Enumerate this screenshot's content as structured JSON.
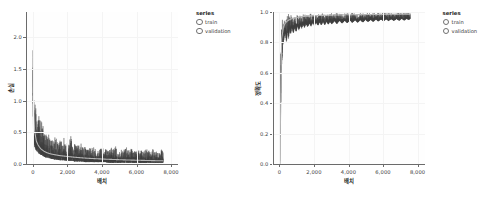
{
  "legend": {
    "title": "series",
    "items": [
      {
        "label": "train",
        "marker": "circle-outline-icon",
        "color": "#3d3d3d"
      },
      {
        "label": "validation",
        "marker": "circle-outline-icon",
        "color": "#b9b9b9"
      }
    ]
  },
  "colors": {
    "train": "#3d3d3d",
    "validation": "#b5b5b5",
    "axis": "#6b6b6b",
    "grid": "#f4f4f4",
    "text": "#3a3a3a",
    "title": "#1d1d1d",
    "plot_background": "#fefefe",
    "page_background": "#ffffff"
  },
  "chart_data": [
    {
      "type": "line",
      "title": "",
      "xlabel": "배치",
      "ylabel": "손실",
      "xlim": [
        -400,
        8400
      ],
      "ylim": [
        0.0,
        2.4
      ],
      "xticks": [
        0,
        2000,
        4000,
        6000,
        8000
      ],
      "xtick_labels": [
        "0",
        "2,000",
        "4,000",
        "6,000",
        "8,000"
      ],
      "yticks": [
        0.0,
        0.5,
        1.0,
        1.5,
        2.0
      ],
      "ytick_labels": [
        "0.0",
        "0.5",
        "1.0",
        "1.5",
        "2.0"
      ],
      "grid": true,
      "legend_position": "right",
      "series": [
        {
          "name": "train",
          "color": "#3d3d3d",
          "description": "noisy per-batch training loss, starts ~2.3, decays rapidly then oscillates",
          "x": [
            0,
            40,
            80,
            120,
            160,
            200,
            260,
            320,
            380,
            440,
            500,
            560,
            620,
            700,
            780,
            860,
            940,
            1020,
            1100,
            1180,
            1260,
            1340,
            1420,
            1500,
            1600,
            1700,
            1800,
            1900,
            2000,
            2100,
            2200,
            2300,
            2400,
            2500,
            2600,
            2700,
            2800,
            2900,
            3000,
            3150,
            3300,
            3450,
            3600,
            3750,
            3900,
            4050,
            4200,
            4350,
            4500,
            4650,
            4800,
            4950,
            5100,
            5250,
            5400,
            5550,
            5700,
            5850,
            6000,
            6150,
            6300,
            6450,
            6600,
            6750,
            6900,
            7050,
            7200,
            7350,
            7450,
            7550
          ],
          "upper": [
            2.3,
            1.2,
            0.9,
            0.86,
            0.84,
            0.8,
            0.76,
            0.72,
            0.68,
            0.64,
            0.6,
            0.56,
            0.52,
            0.5,
            0.47,
            0.45,
            0.42,
            0.4,
            0.38,
            0.37,
            0.36,
            0.45,
            0.33,
            0.32,
            0.42,
            0.3,
            0.38,
            0.29,
            0.31,
            0.28,
            0.46,
            0.27,
            0.32,
            0.26,
            0.3,
            0.25,
            0.29,
            0.25,
            0.28,
            0.24,
            0.27,
            0.23,
            0.26,
            0.23,
            0.25,
            0.22,
            0.26,
            0.22,
            0.24,
            0.21,
            0.25,
            0.21,
            0.23,
            0.2,
            0.24,
            0.2,
            0.22,
            0.2,
            0.23,
            0.19,
            0.22,
            0.19,
            0.21,
            0.19,
            0.22,
            0.18,
            0.21,
            0.18,
            0.26,
            0.17
          ],
          "lower": [
            0.95,
            0.45,
            0.3,
            0.26,
            0.23,
            0.21,
            0.19,
            0.17,
            0.16,
            0.15,
            0.14,
            0.13,
            0.12,
            0.11,
            0.1,
            0.1,
            0.09,
            0.09,
            0.08,
            0.08,
            0.07,
            0.07,
            0.07,
            0.06,
            0.06,
            0.06,
            0.06,
            0.05,
            0.05,
            0.05,
            0.05,
            0.05,
            0.04,
            0.04,
            0.04,
            0.04,
            0.04,
            0.04,
            0.03,
            0.03,
            0.03,
            0.03,
            0.03,
            0.03,
            0.03,
            0.03,
            0.03,
            0.02,
            0.02,
            0.02,
            0.02,
            0.02,
            0.02,
            0.02,
            0.02,
            0.02,
            0.02,
            0.02,
            0.02,
            0.02,
            0.02,
            0.02,
            0.02,
            0.02,
            0.02,
            0.02,
            0.02,
            0.02,
            0.02,
            0.02
          ]
        },
        {
          "name": "validation",
          "color": "#b5b5b5",
          "description": "smooth validation loss, decays from ~1.1 to ~0.05",
          "x": [
            0,
            100,
            200,
            300,
            400,
            500,
            650,
            800,
            950,
            1100,
            1300,
            1500,
            1700,
            1900,
            2100,
            2300,
            2500,
            2800,
            3100,
            3400,
            3700,
            4000,
            4300,
            4600,
            4900,
            5200,
            5500,
            5800,
            6100,
            6400,
            6700,
            7000,
            7300,
            7550
          ],
          "y": [
            1.08,
            0.52,
            0.36,
            0.3,
            0.26,
            0.23,
            0.2,
            0.18,
            0.165,
            0.155,
            0.145,
            0.135,
            0.128,
            0.122,
            0.116,
            0.11,
            0.105,
            0.098,
            0.092,
            0.087,
            0.083,
            0.079,
            0.075,
            0.072,
            0.069,
            0.066,
            0.063,
            0.061,
            0.059,
            0.057,
            0.055,
            0.053,
            0.051,
            0.05
          ]
        }
      ]
    },
    {
      "type": "line",
      "title": "",
      "xlabel": "배치",
      "ylabel": "정확도",
      "xlim": [
        -400,
        8400
      ],
      "ylim": [
        0.0,
        1.0
      ],
      "xticks": [
        0,
        2000,
        4000,
        6000,
        8000
      ],
      "xtick_labels": [
        "0",
        "2,000",
        "4,000",
        "6,000",
        "8,000"
      ],
      "yticks": [
        0.0,
        0.2,
        0.4,
        0.6,
        0.8,
        1.0
      ],
      "ytick_labels": [
        "0.0",
        "0.2",
        "0.4",
        "0.6",
        "0.8",
        "1.0"
      ],
      "grid": true,
      "legend_position": "right",
      "series": [
        {
          "name": "train",
          "color": "#3d3d3d",
          "description": "noisy per-batch training accuracy, rises from ~0.0 to ~0.99 with downward spikes",
          "x": [
            0,
            40,
            80,
            120,
            160,
            200,
            260,
            320,
            380,
            440,
            500,
            560,
            620,
            700,
            780,
            860,
            940,
            1020,
            1100,
            1180,
            1260,
            1340,
            1420,
            1500,
            1600,
            1700,
            1800,
            1900,
            2000,
            2100,
            2200,
            2300,
            2400,
            2500,
            2600,
            2700,
            2800,
            2900,
            3000,
            3150,
            3300,
            3450,
            3600,
            3750,
            3900,
            4050,
            4200,
            4350,
            4500,
            4650,
            4800,
            4950,
            5100,
            5250,
            5400,
            5550,
            5700,
            5850,
            6000,
            6150,
            6300,
            6450,
            6600,
            6750,
            6900,
            7050,
            7200,
            7350,
            7450,
            7550
          ],
          "upper": [
            0.1,
            0.78,
            0.9,
            0.93,
            0.94,
            0.95,
            0.955,
            0.96,
            0.962,
            0.965,
            0.967,
            0.968,
            0.97,
            0.971,
            0.972,
            0.973,
            0.974,
            0.975,
            0.975,
            0.976,
            0.977,
            0.977,
            0.978,
            0.978,
            0.979,
            0.979,
            0.98,
            0.98,
            0.981,
            0.981,
            0.982,
            0.982,
            0.982,
            0.983,
            0.983,
            0.983,
            0.984,
            0.984,
            0.984,
            0.985,
            0.985,
            0.985,
            0.986,
            0.986,
            0.986,
            0.987,
            0.987,
            0.987,
            0.987,
            0.988,
            0.988,
            0.988,
            0.988,
            0.989,
            0.989,
            0.989,
            0.989,
            0.99,
            0.99,
            0.99,
            0.99,
            0.99,
            0.991,
            0.991,
            0.991,
            0.991,
            0.991,
            0.992,
            0.992,
            0.992
          ],
          "lower": [
            0.0,
            0.33,
            0.6,
            0.7,
            0.78,
            0.8,
            0.84,
            0.86,
            0.8,
            0.88,
            0.82,
            0.89,
            0.855,
            0.9,
            0.86,
            0.905,
            0.87,
            0.91,
            0.88,
            0.915,
            0.89,
            0.92,
            0.895,
            0.925,
            0.9,
            0.928,
            0.905,
            0.93,
            0.908,
            0.932,
            0.91,
            0.934,
            0.912,
            0.936,
            0.915,
            0.938,
            0.918,
            0.94,
            0.92,
            0.941,
            0.922,
            0.943,
            0.925,
            0.944,
            0.927,
            0.946,
            0.929,
            0.947,
            0.93,
            0.948,
            0.932,
            0.949,
            0.934,
            0.95,
            0.936,
            0.951,
            0.938,
            0.952,
            0.94,
            0.953,
            0.941,
            0.954,
            0.942,
            0.955,
            0.943,
            0.956,
            0.944,
            0.957,
            0.945,
            0.958
          ]
        },
        {
          "name": "validation",
          "color": "#b5b5b5",
          "description": "smooth validation accuracy, rises from ~0.0 to ~0.985",
          "x": [
            0,
            100,
            200,
            300,
            400,
            500,
            650,
            800,
            950,
            1100,
            1300,
            1500,
            1700,
            1900,
            2100,
            2300,
            2500,
            2800,
            3100,
            3400,
            3700,
            4000,
            4300,
            4600,
            4900,
            5200,
            5500,
            5800,
            6100,
            6400,
            6700,
            7000,
            7300,
            7550
          ],
          "y": [
            0.02,
            0.82,
            0.9,
            0.925,
            0.938,
            0.946,
            0.954,
            0.96,
            0.964,
            0.967,
            0.97,
            0.972,
            0.974,
            0.975,
            0.976,
            0.977,
            0.978,
            0.979,
            0.98,
            0.981,
            0.981,
            0.982,
            0.982,
            0.983,
            0.983,
            0.984,
            0.984,
            0.984,
            0.985,
            0.985,
            0.985,
            0.986,
            0.986,
            0.986
          ]
        }
      ]
    }
  ]
}
